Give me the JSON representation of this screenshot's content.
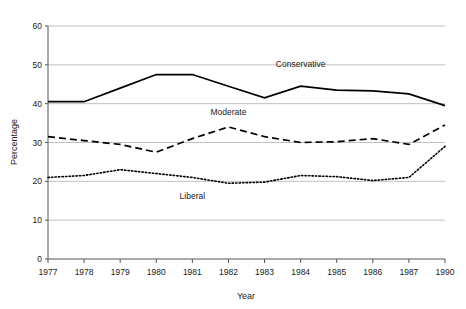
{
  "figure": {
    "clipped_header_text": "",
    "background_color": "#ffffff",
    "line_color": "#000000",
    "gridline_color": "#b0b0b0",
    "axis_color": "#555555"
  },
  "axes": {
    "y_title": "Percentage",
    "x_title": "Year",
    "y_ticks": [
      "0",
      "10",
      "20",
      "30",
      "40",
      "50",
      "60"
    ],
    "x_ticks": [
      "1977",
      "1978",
      "1979",
      "1980",
      "1981",
      "1982",
      "1983",
      "1984",
      "1985",
      "1986",
      "1987",
      "1990"
    ]
  },
  "series_labels": {
    "conservative": "Conservative",
    "moderate": "Moderate",
    "liberal": "Liberal"
  },
  "chart_data": {
    "type": "line",
    "title": "",
    "xlabel": "Year",
    "ylabel": "Percentage",
    "x": [
      1977,
      1978,
      1979,
      1980,
      1981,
      1982,
      1983,
      1984,
      1985,
      1986,
      1987,
      1990
    ],
    "x_tick_labels": [
      "1977",
      "1978",
      "1979",
      "1980",
      "1981",
      "1982",
      "1983",
      "1984",
      "1985",
      "1986",
      "1987",
      "1990"
    ],
    "xlim": [
      1977,
      1990
    ],
    "ylim": [
      0,
      60
    ],
    "y_ticks": [
      0,
      10,
      20,
      30,
      40,
      50,
      60
    ],
    "grid": "horizontal",
    "legend": "inline-labels",
    "series": [
      {
        "name": "Conservative",
        "linestyle": "solid",
        "color": "#000000",
        "values": [
          40.5,
          40.5,
          44.0,
          47.5,
          47.5,
          44.5,
          41.5,
          44.5,
          43.5,
          43.3,
          42.5,
          39.5
        ]
      },
      {
        "name": "Moderate",
        "linestyle": "dashed",
        "color": "#000000",
        "values": [
          31.5,
          30.5,
          29.5,
          27.5,
          31.0,
          34.0,
          31.5,
          30.0,
          30.2,
          31.0,
          29.5,
          34.5
        ]
      },
      {
        "name": "Liberal",
        "linestyle": "dotted",
        "color": "#000000",
        "values": [
          21.0,
          21.5,
          23.0,
          22.0,
          21.0,
          19.5,
          19.8,
          21.5,
          21.2,
          20.2,
          21.0,
          29.0
        ]
      }
    ],
    "annotations": [
      {
        "text": "Conservative",
        "x": 1984,
        "y": 49.5
      },
      {
        "text": "Moderate",
        "x": 1982,
        "y": 37.0
      },
      {
        "text": "Liberal",
        "x": 1981,
        "y": 15.5
      }
    ]
  }
}
